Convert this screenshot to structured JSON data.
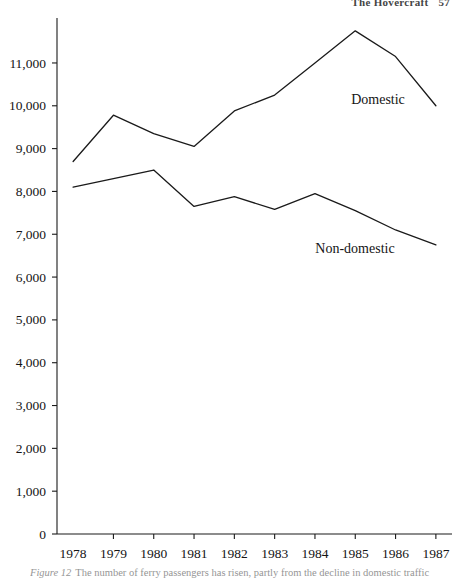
{
  "running_head": {
    "title": "The Hovercraft",
    "page_number": "57"
  },
  "caption": {
    "number": "Figure 12",
    "text": "The number of ferry passengers has risen, partly from the decline in domestic traffic"
  },
  "chart_data": {
    "type": "line",
    "title": "",
    "xlabel": "",
    "ylabel": "",
    "x": [
      1978,
      1979,
      1980,
      1981,
      1982,
      1983,
      1984,
      1985,
      1986,
      1987
    ],
    "categories": [
      "1978",
      "1979",
      "1980",
      "1981",
      "1982",
      "1983",
      "1984",
      "1985",
      "1986",
      "1987"
    ],
    "series": [
      {
        "name": "Domestic",
        "values": [
          8700,
          9780,
          9350,
          9050,
          9880,
          10250,
          11000,
          11750,
          11150,
          10000
        ],
        "color": "#1a1a1a"
      },
      {
        "name": "Non-domestic",
        "values": [
          8100,
          8300,
          8500,
          7650,
          7880,
          7580,
          7950,
          7550,
          7100,
          6750
        ],
        "color": "#1a1a1a"
      }
    ],
    "ylim": [
      0,
      12050
    ],
    "xlim": [
      1977.6,
      1987.4
    ],
    "y_ticks": [
      0,
      1000,
      2000,
      3000,
      4000,
      5000,
      6000,
      7000,
      8000,
      9000,
      10000,
      11000
    ],
    "y_tick_labels": [
      "0",
      "1,000",
      "2,000",
      "3,000",
      "4,000",
      "5,000",
      "6,000",
      "7,000",
      "8,000",
      "9,000",
      "10,000",
      "11,000"
    ],
    "x_tick_labels": [
      "1978",
      "1979",
      "1980",
      "1981",
      "1982",
      "1983",
      "1984",
      "1985",
      "1986",
      "1987"
    ],
    "grid": false,
    "legend": "inline-end-of-line",
    "annotations": [
      {
        "text": "Domestic",
        "series": "Domestic",
        "x_px": 378,
        "y_px": 104
      },
      {
        "text": "Non-domestic",
        "series": "Non-domestic",
        "x_px": 355,
        "y_px": 253
      }
    ]
  }
}
